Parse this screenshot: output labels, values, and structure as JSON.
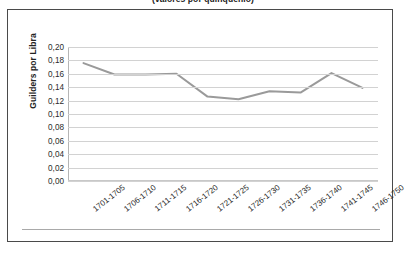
{
  "caption": {
    "text_clipped": "(valores por quinquenio)"
  },
  "chart_data": {
    "type": "line",
    "title": "",
    "xlabel": "",
    "ylabel": "Guilders por Libra",
    "categories": [
      "1701-1705",
      "1706-1710",
      "1711-1715",
      "1716-1720",
      "1721-1725",
      "1726-1730",
      "1731-1735",
      "1736-1740",
      "1741-1745",
      "1746-1750"
    ],
    "values": [
      0.176,
      0.159,
      0.159,
      0.16,
      0.126,
      0.122,
      0.134,
      0.132,
      0.161,
      0.139
    ],
    "ylim": [
      0.0,
      0.2
    ],
    "ytick_labels": [
      "0,20",
      "0,18",
      "0,16",
      "0,14",
      "0,12",
      "0,10",
      "0,08",
      "0,06",
      "0,04",
      "0,02",
      "0,00"
    ],
    "ytick_values": [
      0.2,
      0.18,
      0.16,
      0.14,
      0.12,
      0.1,
      0.08,
      0.06,
      0.04,
      0.02,
      0.0
    ],
    "grid": true,
    "legend": "none",
    "series_color": "#9a9a9a",
    "gridline_color": "#d2d2d2",
    "frame_color": "#4a4a4a"
  }
}
